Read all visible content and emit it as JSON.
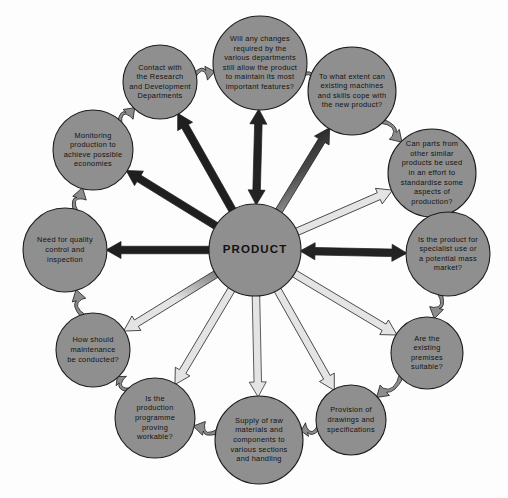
{
  "diagram": {
    "type": "radial-hub-and-spoke",
    "title_text": "PRODUCT",
    "background_color": "#fdfdfd",
    "node_fill_color": "#8f8f8f",
    "node_stroke_color": "#1d1d1d",
    "text_color": "#121212",
    "arrow_dark_color": "#2b2b2b",
    "arrow_light_color": "#d8d8d8",
    "ring_connector_color": "#8c8c8c",
    "center": {
      "id": "product",
      "label": "PRODUCT",
      "cx": 255,
      "cy": 250,
      "r": 46
    },
    "satellites": [
      {
        "id": "changes-departments",
        "label": "Will any changes required by the various departments still allow the product to maintain its most important features?",
        "lines": [
          "Will any changes",
          "required by the",
          "various departments",
          "still allow the product",
          "to maintain its most",
          "important features?"
        ],
        "cx": 260,
        "cy": 63,
        "r": 47,
        "angle_deg": 268,
        "spoke": "double"
      },
      {
        "id": "existing-machines-skills",
        "label": "To what extent can existing machines and skills cope with the new product?",
        "lines": [
          "To what extent can",
          "existing machines",
          "and skills cope with",
          "the new product?"
        ],
        "cx": 352,
        "cy": 91,
        "r": 44,
        "angle_deg": 301,
        "spoke": "single-out"
      },
      {
        "id": "standardise-parts",
        "label": "Can parts from other similar products be used in an effort to standardise some aspects of production?",
        "lines": [
          "Can parts from",
          "other similar",
          "products be used",
          "in an effort to",
          "standardise some",
          "aspects of",
          "production?"
        ],
        "cx": 432,
        "cy": 173,
        "r": 44,
        "angle_deg": 331,
        "spoke": "single-out"
      },
      {
        "id": "specialist-or-mass-market",
        "label": "Is the product for specialist use or a potential mass market?",
        "lines": [
          "Is the product for",
          "specialist use or",
          "a potential mass",
          "market?"
        ],
        "cx": 448,
        "cy": 254,
        "r": 42,
        "angle_deg": 1,
        "spoke": "double"
      },
      {
        "id": "existing-premises",
        "label": "Are the existing premises suitable?",
        "lines": [
          "Are the",
          "existing",
          "premises",
          "suitable?"
        ],
        "cx": 427,
        "cy": 353,
        "r": 36,
        "angle_deg": 32,
        "spoke": "single-out"
      },
      {
        "id": "drawings-specifications",
        "label": "Provision of drawings and specifications",
        "lines": [
          "Provision of",
          "drawings and",
          "specifications"
        ],
        "cx": 351,
        "cy": 420,
        "r": 35,
        "angle_deg": 59,
        "spoke": "single-out"
      },
      {
        "id": "supply-raw-materials",
        "label": "Supply of raw materials and components to various sections and handling",
        "lines": [
          "Supply of raw",
          "materials and",
          "components to",
          "various sections",
          "and handling"
        ],
        "cx": 259,
        "cy": 440,
        "r": 44,
        "angle_deg": 89,
        "spoke": "single-out"
      },
      {
        "id": "production-programme-workable",
        "label": "Is the production programme proving workable?",
        "lines": [
          "Is the",
          "production",
          "programme",
          "proving",
          "workable?"
        ],
        "cx": 155,
        "cy": 418,
        "r": 40,
        "angle_deg": 121,
        "spoke": "single-out"
      },
      {
        "id": "maintenance-conducted",
        "label": "How should maintenance be conducted?",
        "lines": [
          "How should",
          "maintenance",
          "be conducted?"
        ],
        "cx": 93,
        "cy": 350,
        "r": 37,
        "angle_deg": 149,
        "spoke": "single-out"
      },
      {
        "id": "quality-control-inspection",
        "label": "Need for quality control and inspection",
        "lines": [
          "Need for quality",
          "control and",
          "inspection"
        ],
        "cx": 65,
        "cy": 250,
        "r": 42,
        "angle_deg": 180,
        "spoke": "single-out"
      },
      {
        "id": "monitoring-production-economies",
        "label": "Monitoring production to achieve possible economies",
        "lines": [
          "Monitoring",
          "production to",
          "achieve possible",
          "economies"
        ],
        "cx": 93,
        "cy": 150,
        "r": 40,
        "angle_deg": 211,
        "spoke": "single-out"
      },
      {
        "id": "research-development-contact",
        "label": "Contact with the Research and Development Departments",
        "lines": [
          "Contact with",
          "the Research",
          "and Development",
          "Departments"
        ],
        "cx": 160,
        "cy": 82,
        "r": 37,
        "angle_deg": 240,
        "spoke": "single-out"
      }
    ],
    "ring_links": [
      {
        "from": "research-development-contact",
        "to": "changes-departments"
      },
      {
        "from": "changes-departments",
        "to": "existing-machines-skills"
      },
      {
        "from": "existing-machines-skills",
        "to": "standardise-parts"
      },
      {
        "from": "standardise-parts",
        "to": "specialist-or-mass-market"
      },
      {
        "from": "specialist-or-mass-market",
        "to": "existing-premises"
      },
      {
        "from": "existing-premises",
        "to": "drawings-specifications"
      },
      {
        "from": "drawings-specifications",
        "to": "supply-raw-materials"
      },
      {
        "from": "supply-raw-materials",
        "to": "production-programme-workable"
      },
      {
        "from": "production-programme-workable",
        "to": "maintenance-conducted"
      },
      {
        "from": "maintenance-conducted",
        "to": "quality-control-inspection"
      },
      {
        "from": "quality-control-inspection",
        "to": "monitoring-production-economies"
      },
      {
        "from": "monitoring-production-economies",
        "to": "research-development-contact"
      }
    ]
  }
}
